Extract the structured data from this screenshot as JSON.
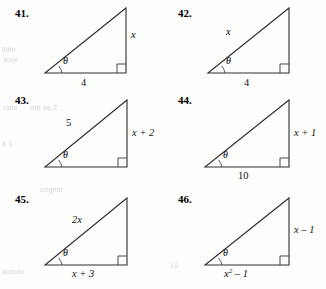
{
  "page": {
    "title": "Right triangle exercises 41-46",
    "ghost_texts": [
      "ilitin",
      "eoyl",
      "ralis",
      "the se 2",
      "a 1",
      "ongmir",
      "oosulo",
      "10"
    ]
  },
  "problems": [
    {
      "number": "41.",
      "theta": "θ",
      "labels": {
        "vertical": "x",
        "base": "4",
        "hypotenuse": ""
      }
    },
    {
      "number": "42.",
      "theta": "θ",
      "labels": {
        "vertical": "",
        "base": "4",
        "hypotenuse": "x"
      }
    },
    {
      "number": "43.",
      "theta": "θ",
      "labels": {
        "vertical": "x + 2",
        "base": "",
        "hypotenuse": "5"
      }
    },
    {
      "number": "44.",
      "theta": "θ",
      "labels": {
        "vertical": "x + 1",
        "base": "10",
        "hypotenuse": ""
      }
    },
    {
      "number": "45.",
      "theta": "θ",
      "labels": {
        "vertical": "",
        "base": "x + 3",
        "hypotenuse": "2x"
      }
    },
    {
      "number": "46.",
      "theta": "θ",
      "labels": {
        "vertical": "x – 1",
        "base_pre": "x",
        "base_sup": "2",
        "base_post": " – 1",
        "hypotenuse": ""
      }
    }
  ]
}
